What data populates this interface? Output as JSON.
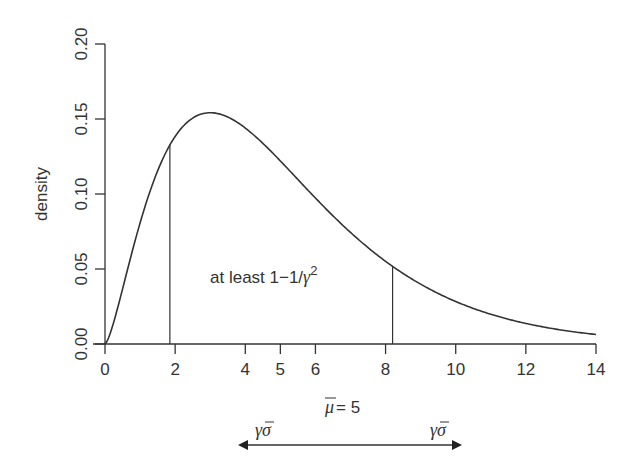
{
  "chart_data": {
    "type": "line",
    "title": "",
    "xlabel": "",
    "ylabel": "density",
    "xlim": [
      0,
      14
    ],
    "ylim": [
      0,
      0.2
    ],
    "x_ticks": [
      0,
      2,
      4,
      5,
      6,
      8,
      10,
      12,
      14
    ],
    "x_tick_labels": [
      "0",
      "2",
      "4",
      "5",
      "6",
      "8",
      "10",
      "12",
      "14"
    ],
    "y_ticks": [
      0.0,
      0.05,
      0.1,
      0.15,
      0.2
    ],
    "y_tick_labels": [
      "0.00",
      "0.05",
      "0.10",
      "0.15",
      "0.20"
    ],
    "grid": false,
    "series": [
      {
        "name": "density curve (gamma-shaped, shape 2.5, scale 2)",
        "x": [
          0,
          0.5,
          1,
          1.5,
          1.85,
          2,
          2.5,
          3,
          3.5,
          4,
          5,
          6,
          7,
          8,
          8.2,
          9,
          10,
          11,
          12,
          13,
          14
        ],
        "y": [
          0,
          0.046,
          0.081,
          0.11,
          0.13,
          0.135,
          0.149,
          0.154,
          0.152,
          0.146,
          0.126,
          0.104,
          0.082,
          0.062,
          0.059,
          0.046,
          0.034,
          0.024,
          0.017,
          0.012,
          0.008
        ]
      }
    ],
    "vertical_lines": [
      {
        "x": 1.85,
        "y_top": 0.13
      },
      {
        "x": 8.2,
        "y_top": 0.053
      }
    ],
    "annotations": [
      {
        "text": "at least 1−1/γ²",
        "x": 3.0,
        "y": 0.045
      },
      {
        "text": "μ̄ = 5",
        "position": "below x-axis at x=5"
      },
      {
        "text": "γσ̄",
        "position": "left arrow label"
      },
      {
        "text": "γσ̄",
        "position": "right arrow label"
      }
    ],
    "arrow": {
      "from_x": 3.8,
      "to_x": 10.2,
      "style": "double-headed, centered on mean"
    }
  },
  "labels": {
    "ylabel": "density",
    "annotation_prefix": "at least 1−1/",
    "annotation_gamma": "γ",
    "annotation_exp": "2",
    "mean_mu": "μ",
    "mean_rest": " = 5",
    "arrow_left_label": "γσ",
    "arrow_right_label": "γσ"
  },
  "colors": {
    "line": "#333333",
    "background": "#ffffff"
  }
}
